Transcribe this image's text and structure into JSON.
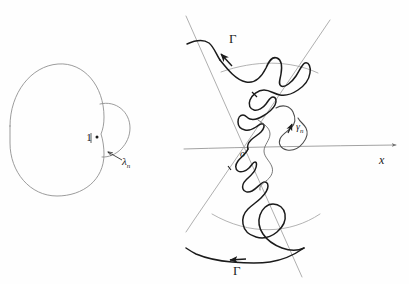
{
  "figure": {
    "ink_color": "#1b1b1b",
    "guide_color": "#9a9a9a",
    "background_color": "#fefefe"
  },
  "left_panel": {
    "name": "unit-circle-with-small-arc",
    "point_label": "1",
    "arc_label": "λ",
    "arc_label_sub": "n",
    "circle": {
      "cx": 57,
      "cy": 130,
      "r": 47
    },
    "small_arc": {
      "start_x": 100,
      "start_y": 104,
      "end_x": 103,
      "end_y": 157,
      "bulge_x": 130
    }
  },
  "right_panel": {
    "name": "cone-and-contour",
    "origin_label": "o",
    "axis_label": "x",
    "contour_label_top": "Γ",
    "contour_label_bottom": "Γ",
    "wiggle_label": "γ",
    "wiggle_label_sub": "n",
    "axis": {
      "x1": 185,
      "y1": 148,
      "x2": 400,
      "y2": 146
    },
    "cone_apex": {
      "x": 244,
      "y": 147
    },
    "cone_half_angle_deg": 20
  },
  "labels": [
    {
      "id": "one",
      "text": "1",
      "x": 89,
      "y": 141
    },
    {
      "id": "lambda-n",
      "text": "λ",
      "sub": "n",
      "x": 122,
      "y": 163
    },
    {
      "id": "gamma-top",
      "text": "Γ",
      "x": 229,
      "y": 40
    },
    {
      "id": "gamma-bot",
      "text": "Γ",
      "x": 233,
      "y": 271
    },
    {
      "id": "gamma-n",
      "text": "γ",
      "sub": "n",
      "x": 296,
      "y": 127
    },
    {
      "id": "origin",
      "text": "o",
      "x": 243,
      "y": 154
    },
    {
      "id": "x-axis",
      "text": "x",
      "x": 382,
      "y": 161
    }
  ]
}
